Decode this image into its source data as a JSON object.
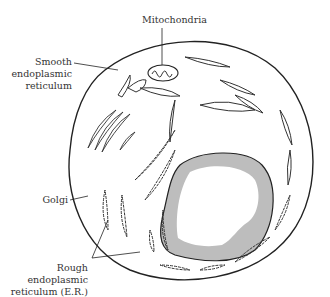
{
  "diagram": {
    "labels": {
      "mitochondria": "Mitochondria",
      "smooth_er_1": "Smooth",
      "smooth_er_2": "endoplasmic",
      "smooth_er_3": "reticulum",
      "golgi": "Golgi",
      "rough_er_1": "Rough",
      "rough_er_2": "endoplasmic",
      "rough_er_3": "reticulum (E.R.)"
    },
    "colors": {
      "line": "#222222",
      "nucleus_fill": "#c8c8c8",
      "background": "#ffffff"
    }
  }
}
